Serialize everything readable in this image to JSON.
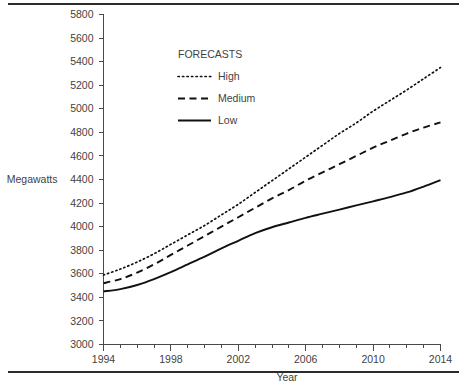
{
  "chart_data": {
    "type": "line",
    "title": "",
    "xlabel": "Year",
    "ylabel": "Megawatts",
    "xlim": [
      1994,
      2014
    ],
    "ylim": [
      3000,
      5800
    ],
    "ytick_step": 200,
    "xtick_step": 4,
    "xminor_step": 1,
    "grid": false,
    "legend_title": "FORECASTS",
    "legend_position": "upper-left-inside",
    "yticks": [
      3000,
      3200,
      3400,
      3600,
      3800,
      4000,
      4200,
      4400,
      4600,
      4800,
      5000,
      5200,
      5400,
      5600,
      5800
    ],
    "xticks": [
      1994,
      1998,
      2002,
      2006,
      2010,
      2014
    ],
    "x": [
      1994,
      1995,
      1996,
      1997,
      1998,
      1999,
      2000,
      2001,
      2002,
      2003,
      2004,
      2005,
      2006,
      2007,
      2008,
      2009,
      2010,
      2011,
      2012,
      2013,
      2014
    ],
    "series": [
      {
        "name": "High",
        "style": "dotted",
        "color": "#111111",
        "values": [
          3590,
          3640,
          3700,
          3770,
          3850,
          3930,
          4010,
          4100,
          4190,
          4290,
          4390,
          4490,
          4590,
          4690,
          4790,
          4880,
          4980,
          5070,
          5160,
          5255,
          5350
        ]
      },
      {
        "name": "Medium",
        "style": "dashed",
        "color": "#111111",
        "values": [
          3520,
          3555,
          3610,
          3680,
          3760,
          3840,
          3920,
          4000,
          4080,
          4160,
          4240,
          4310,
          4390,
          4460,
          4530,
          4600,
          4670,
          4730,
          4790,
          4840,
          4885
        ]
      },
      {
        "name": "Low",
        "style": "solid",
        "color": "#111111",
        "values": [
          3450,
          3470,
          3505,
          3555,
          3615,
          3680,
          3745,
          3815,
          3880,
          3945,
          3995,
          4035,
          4075,
          4110,
          4145,
          4180,
          4215,
          4250,
          4290,
          4340,
          4395
        ]
      }
    ]
  },
  "legend": {
    "title": "FORECASTS",
    "entries": [
      {
        "label": "High"
      },
      {
        "label": "Medium"
      },
      {
        "label": "Low"
      }
    ]
  },
  "axes": {
    "y_title": "Megawatts",
    "x_title": "Year"
  }
}
